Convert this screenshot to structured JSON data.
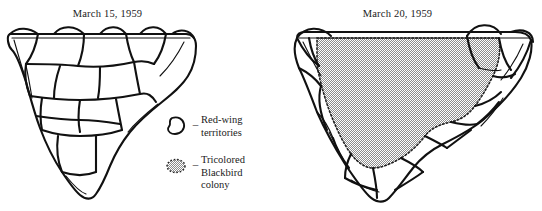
{
  "figure": {
    "background_color": "#ffffff",
    "ink_color": "#111111",
    "stipple_color": "#a8a8a8"
  },
  "panels": [
    {
      "id": "left",
      "title": "March 15, 1959",
      "description": "Marsh outline subdivided into many small Red-wing territory polygons; no colony present."
    },
    {
      "id": "right",
      "title": "March 20, 1959",
      "description": "Same marsh with a large central stippled Tricolored Blackbird colony displacing most Red-wing territories to the margins."
    }
  ],
  "legend": {
    "items": [
      {
        "swatch": "open-blob-outline",
        "dash": "–",
        "label": "Red-wing\nterritories"
      },
      {
        "swatch": "stippled-dashed-oval",
        "dash": "–",
        "label": "Tricolored\nBlackbird\ncolony"
      }
    ]
  }
}
